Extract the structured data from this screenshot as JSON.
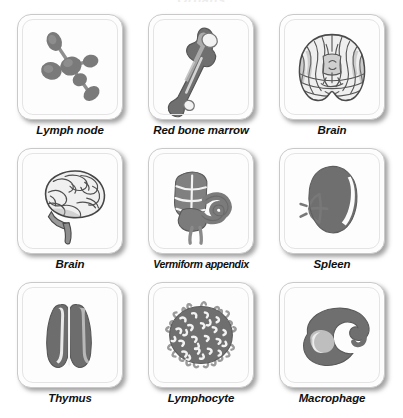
{
  "title": "Organs",
  "colors": {
    "page_background": "#ffffff",
    "card_background": "#fdfdfd",
    "card_border": "#c9c9c9",
    "label_text": "#111111",
    "art_fill_dark": "#6e6e6e",
    "art_fill_mid": "#8a8a8a",
    "art_fill_light": "#bdbdbd",
    "art_outline": "#4a4a4a",
    "shadow": "#5a5a5a"
  },
  "grid": {
    "columns": 3,
    "rows": 3,
    "cells": [
      {
        "label": "Lymph node",
        "icon": "lymph-node-icon"
      },
      {
        "label": "Red bone marrow",
        "icon": "femur-bone-icon"
      },
      {
        "label": "Brain",
        "icon": "brain-coronal-section-icon"
      },
      {
        "label": "Brain",
        "icon": "brain-lateral-icon"
      },
      {
        "label": "Vermiform appendix",
        "icon": "cecum-appendix-icon"
      },
      {
        "label": "Spleen",
        "icon": "spleen-icon"
      },
      {
        "label": "Thymus",
        "icon": "thymus-icon"
      },
      {
        "label": "Lymphocyte",
        "icon": "lymphocyte-cell-icon"
      },
      {
        "label": "Macrophage",
        "icon": "macrophage-cell-icon"
      }
    ]
  }
}
